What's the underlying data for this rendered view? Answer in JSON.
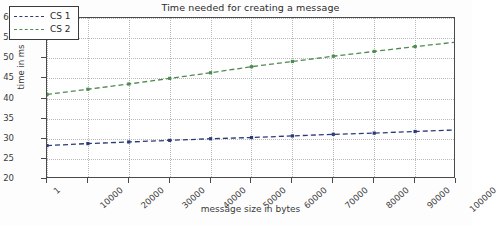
{
  "chart_data": {
    "type": "line",
    "title": "Time needed for creating a message",
    "xlabel": "message size in bytes",
    "ylabel": "time in ms",
    "xlim": [
      1,
      100000
    ],
    "ylim": [
      20,
      60
    ],
    "yticks": [
      20,
      25,
      30,
      35,
      40,
      45,
      50,
      55,
      60
    ],
    "xticks": [
      1,
      10000,
      20000,
      30000,
      40000,
      50000,
      60000,
      70000,
      80000,
      90000,
      100000
    ],
    "xtick_labels": [
      "1",
      "10000",
      "20000",
      "30000",
      "40000",
      "50000",
      "60000",
      "70000",
      "80000",
      "90000",
      "100000"
    ],
    "ytick_labels": [
      "20",
      "25",
      "30",
      "35",
      "40",
      "45",
      "50",
      "55",
      "60"
    ],
    "grid": true,
    "legend_position": "upper left",
    "x": [
      1,
      10000,
      20000,
      30000,
      40000,
      50000,
      60000,
      70000,
      80000,
      90000,
      100000
    ],
    "series": [
      {
        "name": "CS 1",
        "color": "#2a3a7a",
        "linestyle": "dashed",
        "values": [
          28.3,
          28.8,
          29.2,
          29.6,
          30.0,
          30.3,
          30.7,
          31.1,
          31.4,
          31.8,
          32.2
        ]
      },
      {
        "name": "CS 2",
        "color": "#4f8a4f",
        "linestyle": "dashed",
        "values": [
          41.0,
          42.3,
          43.6,
          45.0,
          46.4,
          47.9,
          49.2,
          50.5,
          51.7,
          52.9,
          54.0
        ]
      }
    ]
  },
  "legend": {
    "entries": [
      {
        "label": "CS 1",
        "color": "#2a3a7a"
      },
      {
        "label": "CS 2",
        "color": "#4f8a4f"
      }
    ]
  },
  "colors": {
    "axis": "#4a4a4a",
    "grid": "#b9b9b9",
    "text": "#3a3a3a",
    "background": "#ffffff"
  }
}
